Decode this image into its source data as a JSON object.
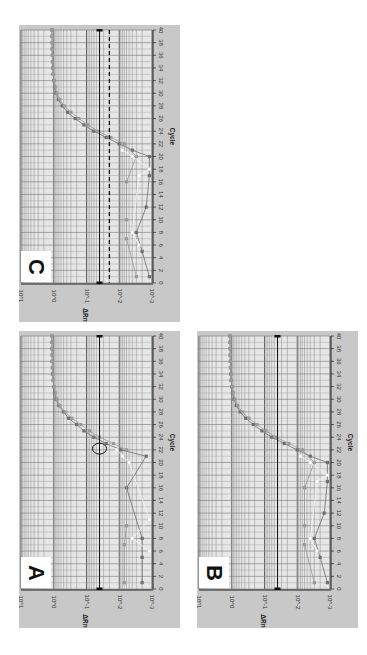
{
  "figure": {
    "orientation": "rotated 90 degrees counter-clockwise",
    "panels": [
      {
        "id": "C",
        "label": "C"
      },
      {
        "id": "A",
        "label": "A"
      },
      {
        "id": "B",
        "label": "B"
      }
    ]
  },
  "chart_data": [
    {
      "type": "scatter",
      "panel": "A",
      "title": "A",
      "xlabel": "Cycle",
      "ylabel": "ΔRn",
      "xlim": [
        0,
        40
      ],
      "ylim": [
        0.001,
        10
      ],
      "yscale": "log",
      "x_ticks": [
        0,
        2,
        4,
        6,
        8,
        10,
        12,
        14,
        16,
        18,
        20,
        22,
        24,
        26,
        28,
        30,
        32,
        34,
        36,
        38,
        40
      ],
      "y_ticks": [
        "10^1",
        "10^0",
        "10^-1",
        "10^-2",
        "10^-3"
      ],
      "grid": true,
      "thresholds": [
        {
          "style": "solid",
          "value": 0.04
        }
      ],
      "annotation": "circle around threshold crossing at cycle ~22",
      "series": [
        {
          "name": "replicate-1 (dark gray)",
          "x": [
            1,
            5,
            8,
            16,
            21,
            22,
            23,
            24,
            25,
            26,
            27,
            28,
            29,
            30,
            31,
            32,
            33,
            34,
            35,
            36,
            37,
            38,
            39,
            40
          ],
          "y": [
            0.002,
            0.002,
            0.002,
            0.006,
            0.0015,
            0.009,
            0.025,
            0.06,
            0.12,
            0.2,
            0.35,
            0.5,
            0.7,
            0.85,
            0.95,
            1.0,
            1.05,
            1.1,
            1.1,
            1.12,
            1.12,
            1.13,
            1.13,
            1.14
          ]
        },
        {
          "name": "replicate-2 (medium gray)",
          "x": [
            1,
            7,
            10,
            22,
            23,
            24,
            25,
            26,
            27,
            28,
            29,
            30,
            31,
            32,
            33,
            34,
            35,
            36,
            37,
            38,
            39,
            40
          ],
          "y": [
            0.007,
            0.007,
            0.006,
            0.006,
            0.015,
            0.04,
            0.08,
            0.15,
            0.28,
            0.45,
            0.65,
            0.8,
            0.9,
            0.97,
            1.02,
            1.05,
            1.08,
            1.1,
            1.1,
            1.12,
            1.12,
            1.13
          ]
        },
        {
          "name": "replicate-3 (white)",
          "x": [
            6,
            8,
            11,
            20,
            21,
            22
          ],
          "y": [
            0.0012,
            0.004,
            0.0012,
            0.005,
            0.008,
            0.012
          ]
        }
      ]
    },
    {
      "type": "scatter",
      "panel": "B",
      "title": "B",
      "xlabel": "Cycle",
      "ylabel": "ΔRn",
      "xlim": [
        0,
        40
      ],
      "ylim": [
        0.001,
        10
      ],
      "yscale": "log",
      "x_ticks": [
        0,
        2,
        4,
        6,
        8,
        10,
        12,
        14,
        16,
        18,
        20,
        22,
        24,
        26,
        28,
        30,
        32,
        34,
        36,
        38,
        40
      ],
      "y_ticks": [
        "10^1",
        "10^0",
        "10^-1",
        "10^-2",
        "10^-3"
      ],
      "grid": true,
      "thresholds": [
        {
          "style": "solid",
          "value": 0.04
        }
      ],
      "series": [
        {
          "name": "replicate-1 (dark gray)",
          "x": [
            1,
            5,
            8,
            12,
            17,
            20,
            21,
            22,
            23,
            24,
            25,
            26,
            27,
            28,
            29,
            30,
            31,
            32,
            33,
            34,
            35,
            36,
            37,
            38,
            39,
            40
          ],
          "y": [
            0.0012,
            0.002,
            0.003,
            0.0015,
            0.0012,
            0.0012,
            0.004,
            0.01,
            0.025,
            0.06,
            0.12,
            0.22,
            0.38,
            0.55,
            0.72,
            0.86,
            0.95,
            1.0,
            1.05,
            1.08,
            1.1,
            1.1,
            1.12,
            1.12,
            1.13,
            1.14
          ]
        },
        {
          "name": "replicate-2 (medium gray)",
          "x": [
            1,
            7,
            10,
            16,
            20,
            22,
            23,
            24,
            25,
            26,
            27,
            28,
            29,
            30,
            31,
            32,
            33,
            34,
            35,
            36,
            37,
            38,
            39,
            40
          ],
          "y": [
            0.003,
            0.006,
            0.006,
            0.006,
            0.003,
            0.007,
            0.018,
            0.045,
            0.09,
            0.17,
            0.3,
            0.48,
            0.66,
            0.8,
            0.9,
            0.97,
            1.02,
            1.05,
            1.08,
            1.1,
            1.1,
            1.12,
            1.12,
            1.13
          ]
        },
        {
          "name": "replicate-3 (white)",
          "x": [
            6,
            8,
            17,
            18,
            20,
            21
          ],
          "y": [
            0.0025,
            0.004,
            0.0025,
            0.0012,
            0.004,
            0.008
          ]
        }
      ]
    },
    {
      "type": "scatter",
      "panel": "C",
      "title": "C",
      "xlabel": "Cycle",
      "ylabel": "ΔRn",
      "xlim": [
        0,
        40
      ],
      "ylim": [
        0.001,
        10
      ],
      "yscale": "log",
      "x_ticks": [
        0,
        2,
        4,
        6,
        8,
        10,
        12,
        14,
        16,
        18,
        20,
        22,
        24,
        26,
        28,
        30,
        32,
        34,
        36,
        38,
        40
      ],
      "y_ticks": [
        "10^1",
        "10^0",
        "10^-1",
        "10^-2",
        "10^-3"
      ],
      "grid": true,
      "thresholds": [
        {
          "style": "solid",
          "value": 0.04
        },
        {
          "style": "dashed",
          "value": 0.02
        }
      ],
      "series": [
        {
          "name": "replicate-1 (dark gray)",
          "x": [
            1,
            5,
            8,
            12,
            17,
            20,
            21,
            22,
            23,
            24,
            25,
            26,
            27,
            28,
            29,
            30,
            31,
            32,
            33,
            34,
            35,
            36,
            37,
            38,
            39,
            40
          ],
          "y": [
            0.0012,
            0.002,
            0.003,
            0.0015,
            0.0012,
            0.0012,
            0.004,
            0.01,
            0.025,
            0.06,
            0.12,
            0.22,
            0.38,
            0.55,
            0.72,
            0.86,
            0.95,
            1.0,
            1.05,
            1.08,
            1.1,
            1.1,
            1.12,
            1.12,
            1.13,
            1.14
          ]
        },
        {
          "name": "replicate-2 (medium gray)",
          "x": [
            1,
            7,
            10,
            16,
            20,
            22,
            23,
            24,
            25,
            26,
            27,
            28,
            29,
            30,
            31,
            32,
            33,
            34,
            35,
            36,
            37,
            38,
            39,
            40
          ],
          "y": [
            0.003,
            0.006,
            0.006,
            0.006,
            0.003,
            0.007,
            0.018,
            0.045,
            0.09,
            0.17,
            0.3,
            0.48,
            0.66,
            0.8,
            0.9,
            0.97,
            1.02,
            1.05,
            1.08,
            1.1,
            1.1,
            1.12,
            1.12,
            1.13
          ]
        },
        {
          "name": "replicate-3 (white)",
          "x": [
            6,
            8,
            17,
            18,
            20,
            21
          ],
          "y": [
            0.0025,
            0.004,
            0.0025,
            0.0012,
            0.004,
            0.008
          ]
        }
      ]
    }
  ],
  "colors": {
    "panel_bg": "#c8c8c8",
    "plot_bg": "#e6e6e6",
    "grid": "#808080",
    "series": [
      "#6e6e6e",
      "#9a9a9a",
      "#ffffff"
    ],
    "threshold": "#111111"
  }
}
